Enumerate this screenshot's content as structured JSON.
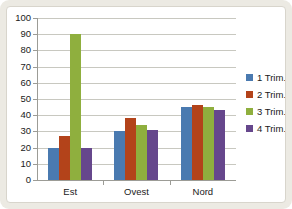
{
  "chart_data": {
    "type": "bar",
    "title": "",
    "xlabel": "",
    "ylabel": "",
    "ylim": [
      0,
      100
    ],
    "ytick_step": 10,
    "yticks": [
      "100",
      "90",
      "80",
      "70",
      "60",
      "50",
      "40",
      "30",
      "20",
      "10",
      "0"
    ],
    "grid": true,
    "legend_position": "right",
    "categories": [
      "Est",
      "Ovest",
      "Nord"
    ],
    "series": [
      {
        "name": "1 Trim.",
        "color": "#4a7ab0",
        "values": [
          20,
          30,
          45
        ]
      },
      {
        "name": "2 Trim.",
        "color": "#b3431a",
        "values": [
          27,
          38,
          46
        ]
      },
      {
        "name": "3 Trim.",
        "color": "#8faf3e",
        "values": [
          90,
          34,
          45
        ]
      },
      {
        "name": "4 Trim.",
        "color": "#66478c",
        "values": [
          20,
          31,
          43
        ]
      }
    ]
  },
  "colors": {
    "frame": "#eceae3",
    "plot_background": "#ffffff",
    "gridline": "#c8c8c0",
    "axis": "#9c9c96",
    "text": "#1a1a1a"
  }
}
